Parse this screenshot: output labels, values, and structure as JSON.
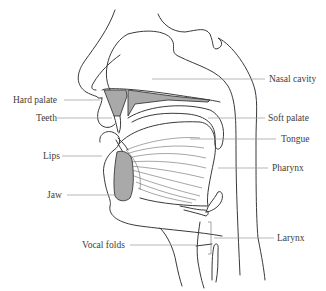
{
  "diagram": {
    "labels_left": [
      {
        "id": "hard-palate",
        "text": "Hard palate"
      },
      {
        "id": "teeth",
        "text": "Teeth"
      },
      {
        "id": "lips",
        "text": "Lips"
      },
      {
        "id": "jaw",
        "text": "Jaw"
      },
      {
        "id": "vocal-folds",
        "text": "Vocal folds"
      }
    ],
    "labels_right": [
      {
        "id": "nasal-cavity",
        "text": "Nasal cavity"
      },
      {
        "id": "soft-palate",
        "text": "Soft palate"
      },
      {
        "id": "tongue",
        "text": "Tongue"
      },
      {
        "id": "pharynx",
        "text": "Pharynx"
      },
      {
        "id": "larynx",
        "text": "Larynx"
      }
    ],
    "colors": {
      "line": "#3a3a3a",
      "leader": "#9a9a9a",
      "bone_fill": "#a9a9a9",
      "text": "#3c3c3c"
    }
  }
}
